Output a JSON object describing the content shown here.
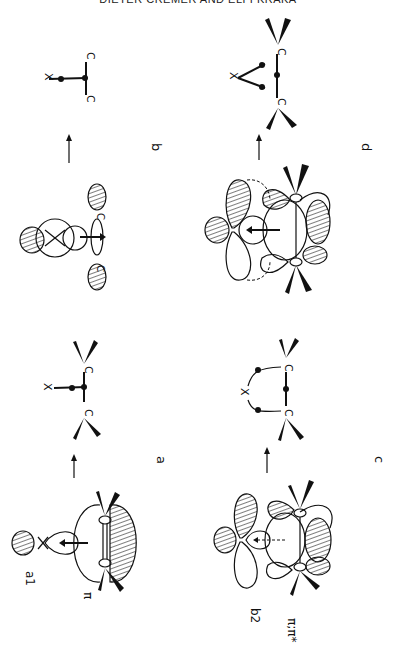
{
  "page": {
    "running_header": "DIETER CREMER AND ELFI KRAKA"
  },
  "figure": {
    "orientation": "rotated 90 degrees",
    "panels": [
      {
        "id": "a",
        "label": "a",
        "orbital_labels": [
          "a1",
          "π"
        ],
        "atoms": [
          "X",
          "C",
          "C"
        ],
        "description": "a1 orbital of X donating into π orbital of C=C; arrow to T-shaped structure"
      },
      {
        "id": "b",
        "label": "b",
        "orbital_labels": [],
        "atoms": [
          "X",
          "C",
          "C"
        ],
        "description": "X lone pair donating into C–C σ; arrow to T-shaped structure"
      },
      {
        "id": "c",
        "label": "c",
        "orbital_labels": [
          "b2",
          "π;π*"
        ],
        "atoms": [
          "X",
          "C",
          "C"
        ],
        "description": "b2 orbital of X interacting with π and π* of C=C; arrow to open bridged structure"
      },
      {
        "id": "d",
        "label": "d",
        "orbital_labels": [],
        "atoms": [
          "X",
          "C",
          "C"
        ],
        "description": "combined interactions; arrow to three-membered ring"
      }
    ],
    "arrow_symbol": "→"
  }
}
